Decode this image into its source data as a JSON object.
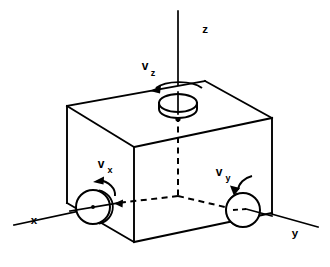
{
  "figure": {
    "background_color": "#ffffff",
    "line_color": "#000000",
    "width": 330,
    "height": 267
  },
  "axes": [
    {
      "id": "x",
      "label": "x",
      "label_x": 34,
      "label_y": 224,
      "description": "x-axis pointing to lower-left"
    },
    {
      "id": "y",
      "label": "y",
      "label_x": 295,
      "label_y": 237,
      "description": "y-axis pointing to lower-right"
    },
    {
      "id": "z",
      "label": "z",
      "label_x": 205,
      "label_y": 33,
      "description": "z-axis pointing up"
    }
  ],
  "velocities": [
    {
      "id": "vx",
      "symbol": "v",
      "subscript": "x",
      "label_x": 101,
      "label_y": 168,
      "sub_x": 110,
      "sub_y": 173,
      "rotation_sense": "counterclockwise",
      "axis": "x"
    },
    {
      "id": "vy",
      "symbol": "v",
      "subscript": "y",
      "label_x": 219,
      "label_y": 176,
      "sub_x": 228,
      "sub_y": 181,
      "rotation_sense": "counterclockwise",
      "axis": "y"
    },
    {
      "id": "vz",
      "symbol": "v",
      "subscript": "z",
      "label_x": 145,
      "label_y": 70,
      "sub_x": 153,
      "sub_y": 76,
      "rotation_sense": "counterclockwise",
      "axis": "z"
    }
  ],
  "disks": [
    {
      "id": "disk-x",
      "cx": 93,
      "cy": 207,
      "r": 17,
      "axis": "x",
      "description": "disk on left face rotating about x"
    },
    {
      "id": "disk-y",
      "cx": 243,
      "cy": 210,
      "r": 17,
      "axis": "y",
      "description": "disk on right face rotating about y"
    },
    {
      "id": "disk-z",
      "cx": 178,
      "cy": 103,
      "rx": 19,
      "ry": 9,
      "axis": "z",
      "description": "disk on top face rotating about z"
    }
  ],
  "cube": {
    "description": "Wireframe cube drawn in oblique projection",
    "vertices": {
      "top_back_left": [
        67,
        106
      ],
      "top_back_right": [
        205,
        81
      ],
      "top_front_right": [
        272,
        118
      ],
      "top_front_left": [
        134,
        147
      ],
      "bottom_front_left": [
        134,
        242
      ],
      "bottom_front_right": [
        272,
        213
      ],
      "bottom_back_left": [
        67,
        203
      ]
    }
  }
}
